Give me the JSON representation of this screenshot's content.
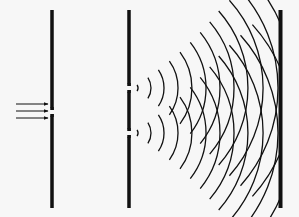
{
  "diagram": {
    "background": "#f7f7f7",
    "ink": "#111111",
    "barriers": [
      {
        "name": "single-slit-barrier",
        "x": 52,
        "width": 3.5,
        "top": 10,
        "bottom": 208,
        "slits": [
          112
        ]
      },
      {
        "name": "double-slit-barrier",
        "x": 129,
        "width": 3.5,
        "top": 10,
        "bottom": 208,
        "slits": [
          88,
          133
        ]
      },
      {
        "name": "screen",
        "x": 280.5,
        "width": 4,
        "top": 10,
        "bottom": 208,
        "slits": []
      }
    ],
    "incident_arrows": {
      "x1": 16,
      "x2": 48,
      "ys": [
        104,
        111,
        118
      ]
    },
    "wave_sources": [
      {
        "cx": 129,
        "cy": 88
      },
      {
        "cx": 129,
        "cy": 133
      }
    ],
    "wavefronts": {
      "radii": [
        6,
        19,
        32,
        46,
        60,
        74,
        88,
        102,
        116,
        131,
        146,
        162
      ],
      "base_half_angle_deg": 32,
      "clip_right": 281
    }
  }
}
